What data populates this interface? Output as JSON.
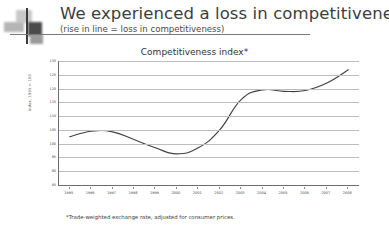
{
  "header": {
    "title": "We experienced a loss in competitiveness...",
    "subtitle": "(rise in line = loss in competitiveness)",
    "logo_icon": "cross-blocks-logo-icon"
  },
  "chart_data": {
    "type": "line",
    "title": "Competitiveness index*",
    "xlabel": "",
    "ylabel": "Index, 1995 = 100",
    "categories": [
      "1995",
      "1996",
      "1997",
      "1998",
      "1999",
      "2000",
      "2001",
      "2002",
      "2003",
      "2004",
      "2005",
      "2006",
      "2007",
      "2008"
    ],
    "x": [
      1995,
      1996,
      1997,
      1998,
      1999,
      2000,
      2001,
      2002,
      2003,
      2004,
      2005,
      2006,
      2007,
      2008
    ],
    "values": [
      102.5,
      104.5,
      104.3,
      101.5,
      98.5,
      96.3,
      98.5,
      105.0,
      116.0,
      119.5,
      119.0,
      119.3,
      122.0,
      126.8
    ],
    "series": [
      {
        "name": "Competitiveness index",
        "color": "#404040",
        "values": [
          102.5,
          104.5,
          104.3,
          101.5,
          98.5,
          96.3,
          98.5,
          105.0,
          116.0,
          119.5,
          119.0,
          119.3,
          122.0,
          126.8
        ]
      }
    ],
    "ylim": [
      85,
      130
    ],
    "ytick_values": [
      130,
      125,
      120,
      115,
      110,
      105,
      100,
      95,
      90,
      85
    ],
    "ytick_labels": [
      "130",
      "125",
      "120",
      "115",
      "110",
      "105",
      "100",
      "95",
      "90",
      "85"
    ],
    "grid": true,
    "legend": "none",
    "line_color": "#404040",
    "gridline_color": "#bdbdbd",
    "axis_color": "#6e6e6e"
  },
  "footnote": "*Trade-weighted exchange rate, adjusted for consumer prices."
}
